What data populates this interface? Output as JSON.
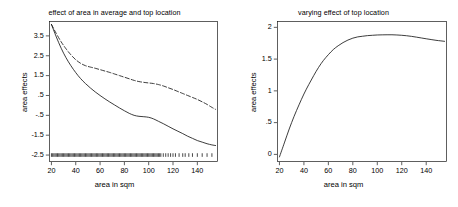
{
  "figure": {
    "background": "#ffffff",
    "foreground": "#1a1a1a",
    "panel_count": 2
  },
  "chart_data": [
    {
      "id": "left",
      "type": "line",
      "title": "effect of area in average and top location",
      "xlabel": "area in sqm",
      "ylabel": "area effects",
      "xlim": [
        18,
        157
      ],
      "ylim": [
        -2.85,
        4.25
      ],
      "xticks": [
        20,
        40,
        60,
        80,
        100,
        120,
        140
      ],
      "xticklabels": [
        "20",
        "40",
        "60",
        "80",
        "100",
        "120",
        "140"
      ],
      "yticks": [
        3.5,
        2.5,
        1.5,
        0.5,
        -0.5,
        -1.5,
        -2.5
      ],
      "yticklabels": [
        "3.5",
        "2.5",
        "1.5",
        ".5",
        "-.5",
        "-1.5",
        "-2.5"
      ],
      "grid": false,
      "legend": null,
      "series": [
        {
          "name": "top location",
          "style": "dashed",
          "color": "#1a1a1a",
          "x": [
            20,
            24,
            28,
            32,
            36,
            40,
            44,
            48,
            52,
            56,
            60,
            64,
            68,
            72,
            76,
            80,
            84,
            88,
            92,
            96,
            100,
            104,
            108,
            112,
            116,
            120,
            124,
            128,
            132,
            136,
            140,
            144,
            148,
            152,
            155
          ],
          "y": [
            4.08,
            3.62,
            3.2,
            2.85,
            2.55,
            2.3,
            2.12,
            2.0,
            1.93,
            1.87,
            1.8,
            1.73,
            1.66,
            1.58,
            1.5,
            1.42,
            1.34,
            1.26,
            1.2,
            1.16,
            1.13,
            1.1,
            1.05,
            0.98,
            0.89,
            0.8,
            0.7,
            0.6,
            0.5,
            0.4,
            0.3,
            0.18,
            0.05,
            -0.1,
            -0.2
          ]
        },
        {
          "name": "average location",
          "style": "solid",
          "color": "#1a1a1a",
          "x": [
            20,
            24,
            28,
            32,
            36,
            40,
            44,
            48,
            52,
            56,
            60,
            64,
            68,
            72,
            76,
            80,
            84,
            88,
            92,
            96,
            100,
            104,
            108,
            112,
            116,
            120,
            124,
            128,
            132,
            136,
            140,
            144,
            148,
            152,
            155
          ],
          "y": [
            4.08,
            3.45,
            2.88,
            2.4,
            2.0,
            1.65,
            1.35,
            1.1,
            0.88,
            0.68,
            0.5,
            0.33,
            0.17,
            0.02,
            -0.13,
            -0.27,
            -0.4,
            -0.5,
            -0.55,
            -0.57,
            -0.6,
            -0.68,
            -0.8,
            -0.92,
            -1.05,
            -1.18,
            -1.3,
            -1.42,
            -1.55,
            -1.66,
            -1.77,
            -1.85,
            -1.93,
            -1.99,
            -2.02
          ]
        }
      ],
      "rug": {
        "name": "data rug",
        "y": -2.5,
        "x": [
          20,
          21,
          22,
          23,
          24,
          25,
          26,
          27,
          28,
          29,
          30,
          31,
          32,
          33,
          34,
          35,
          36,
          37,
          38,
          39,
          40,
          41,
          42,
          43,
          44,
          45,
          46,
          47,
          48,
          49,
          50,
          51,
          52,
          53,
          54,
          55,
          56,
          57,
          58,
          59,
          60,
          61,
          62,
          63,
          64,
          65,
          66,
          67,
          68,
          69,
          70,
          71,
          72,
          73,
          74,
          75,
          76,
          77,
          78,
          79,
          80,
          81,
          82,
          83,
          84,
          85,
          86,
          87,
          88,
          89,
          90,
          91,
          92,
          93,
          94,
          95,
          96,
          97,
          98,
          99,
          100,
          101,
          102,
          103,
          104,
          105,
          106,
          107,
          108,
          109,
          110,
          112,
          114,
          116,
          118,
          120,
          122,
          125,
          128,
          130,
          133,
          136,
          140,
          144,
          148,
          152
        ]
      }
    },
    {
      "id": "right",
      "type": "line",
      "title": "varying effect of top location",
      "xlabel": "area in sqm",
      "ylabel": "area effects",
      "xlim": [
        18,
        157
      ],
      "ylim": [
        -0.12,
        2.1
      ],
      "xticks": [
        20,
        40,
        60,
        80,
        100,
        120,
        140
      ],
      "xticklabels": [
        "20",
        "40",
        "60",
        "80",
        "100",
        "120",
        "140"
      ],
      "yticks": [
        0,
        0.5,
        1,
        1.5,
        2
      ],
      "yticklabels": [
        "0",
        ".5",
        "1",
        "1.5",
        "2"
      ],
      "grid": false,
      "legend": null,
      "series": [
        {
          "name": "varying effect of top location",
          "style": "solid",
          "color": "#1a1a1a",
          "x": [
            20,
            24,
            28,
            32,
            36,
            40,
            44,
            48,
            52,
            56,
            60,
            64,
            68,
            72,
            76,
            80,
            84,
            88,
            92,
            96,
            100,
            104,
            108,
            112,
            116,
            120,
            124,
            128,
            132,
            136,
            140,
            144,
            148,
            152,
            155
          ],
          "y": [
            -0.04,
            0.18,
            0.4,
            0.6,
            0.78,
            0.95,
            1.1,
            1.24,
            1.37,
            1.48,
            1.57,
            1.65,
            1.71,
            1.76,
            1.8,
            1.83,
            1.85,
            1.86,
            1.87,
            1.875,
            1.88,
            1.882,
            1.883,
            1.883,
            1.88,
            1.875,
            1.868,
            1.858,
            1.846,
            1.833,
            1.82,
            1.808,
            1.796,
            1.787,
            1.78
          ]
        }
      ]
    }
  ]
}
